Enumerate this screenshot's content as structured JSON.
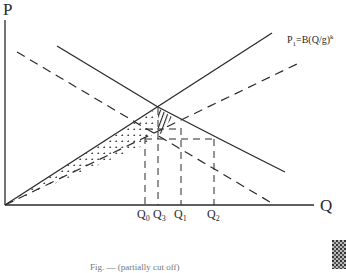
{
  "diagram": {
    "type": "economics supply-demand diagram",
    "axes": {
      "y_label": "P",
      "x_label": "Q"
    },
    "curves": [
      {
        "id": "supply-solid",
        "label_main": "P",
        "label_sub": "1",
        "label_rest": "=B(Q/g)",
        "label_sup": "k",
        "style": "solid",
        "kind": "supply"
      },
      {
        "id": "supply-dashed",
        "style": "dashed",
        "kind": "supply"
      },
      {
        "id": "demand-solid",
        "style": "solid",
        "kind": "demand"
      },
      {
        "id": "demand-dashed",
        "style": "dashed",
        "kind": "demand"
      }
    ],
    "quantities": [
      {
        "main": "Q",
        "sub": "0"
      },
      {
        "main": "Q",
        "sub": "3"
      },
      {
        "main": "Q",
        "sub": "1"
      },
      {
        "main": "Q",
        "sub": "2"
      }
    ],
    "regions": [
      {
        "id": "dotted-triangle",
        "fill": "dotted"
      },
      {
        "id": "hatched-area",
        "fill": "hatched"
      }
    ],
    "caption": "Fig. — (partially cut off)",
    "colors": {
      "ink": "#2a2a2a",
      "background": "#ffffff"
    }
  }
}
